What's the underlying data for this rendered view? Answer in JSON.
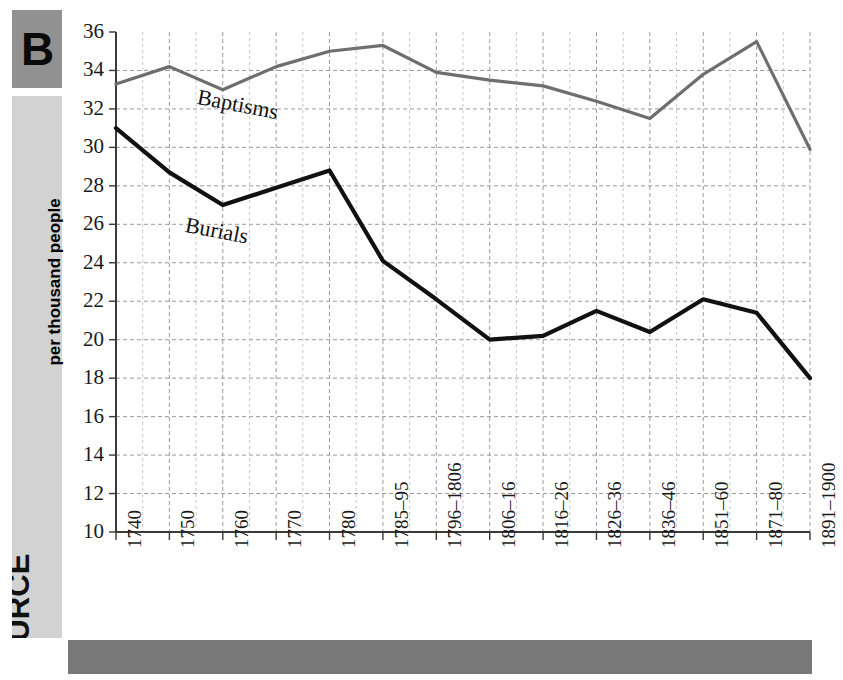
{
  "figure": {
    "letter": "B",
    "source_label": "SOURCE"
  },
  "chart_data": {
    "type": "line",
    "title": "",
    "xlabel": "",
    "ylabel": "per thousand people",
    "ylim": [
      10,
      36
    ],
    "ytick_step": 2,
    "grid": true,
    "legend_position": "inline-on-series",
    "categories": [
      "1740",
      "1750",
      "1760",
      "1770",
      "1780",
      "1785–95",
      "1796–1806",
      "1806–16",
      "1816–26",
      "1826–36",
      "1836–46",
      "1851–60",
      "1871–80",
      "1891–1900"
    ],
    "ytick_labels": [
      "36",
      "34",
      "32",
      "30",
      "28",
      "26",
      "24",
      "22",
      "20",
      "18",
      "16",
      "14",
      "12",
      "10"
    ],
    "ytick_values": [
      36,
      34,
      32,
      30,
      28,
      26,
      24,
      22,
      20,
      18,
      16,
      14,
      12,
      10
    ],
    "series": [
      {
        "name": "Baptisms",
        "color": "#6e6e6e",
        "values": [
          33.3,
          34.2,
          33.0,
          34.2,
          35.0,
          35.3,
          33.9,
          33.5,
          33.2,
          32.4,
          31.5,
          33.8,
          35.5,
          29.9
        ]
      },
      {
        "name": "Burials",
        "color": "#111111",
        "values": [
          31.0,
          28.7,
          27.0,
          27.9,
          28.8,
          24.1,
          22.1,
          20.0,
          20.2,
          21.5,
          20.4,
          22.1,
          21.4,
          18.0
        ]
      }
    ],
    "annotations": [
      {
        "text": "Baptisms",
        "series": "Baptisms"
      },
      {
        "text": "Burials",
        "series": "Burials"
      }
    ]
  },
  "colors": {
    "badge_bg": "#919191",
    "source_bg": "#d2d2d2",
    "bottom_bar": "#787878",
    "grid": "#9a9a9a",
    "axis": "#3a3a3a"
  }
}
